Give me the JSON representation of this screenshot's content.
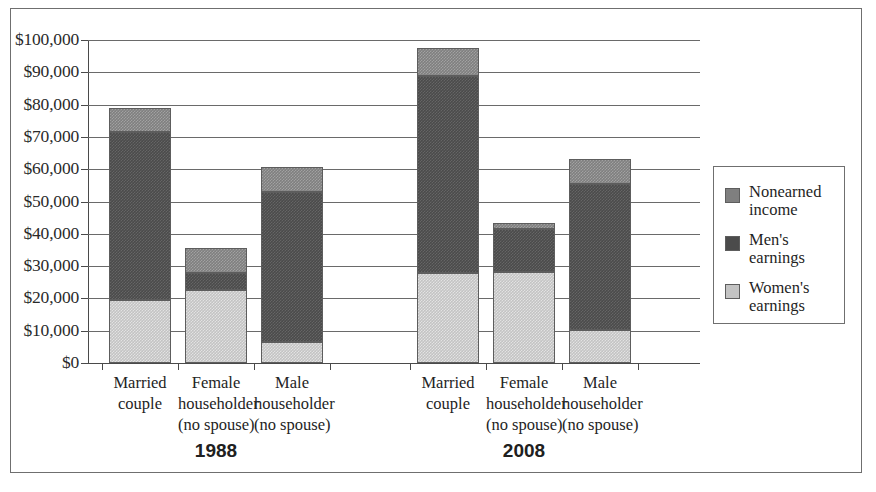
{
  "chart_data": {
    "type": "bar",
    "subtype": "stacked",
    "title": "",
    "xlabel": "",
    "ylabel": "",
    "ylim": [
      0,
      100000
    ],
    "grid": true,
    "legend_position": "right",
    "y_ticks": [
      "$0",
      "$10,000",
      "$20,000",
      "$30,000",
      "$40,000",
      "$50,000",
      "$60,000",
      "$70,000",
      "$80,000",
      "$90,000",
      "$100,000"
    ],
    "y_tick_values": [
      0,
      10000,
      20000,
      30000,
      40000,
      50000,
      60000,
      70000,
      80000,
      90000,
      100000
    ],
    "groups": [
      {
        "label": "1988",
        "categories": [
          {
            "lines": [
              "Married",
              "couple"
            ],
            "women_earnings": 19500,
            "men_earnings": 52000,
            "nonearned_income": 7500,
            "total": 79000
          },
          {
            "lines": [
              "Female",
              "householder",
              "(no spouse)"
            ],
            "women_earnings": 22500,
            "men_earnings": 5300,
            "nonearned_income": 7700,
            "total": 35500
          },
          {
            "lines": [
              "Male",
              "householder",
              "(no spouse)"
            ],
            "women_earnings": 6500,
            "men_earnings": 46500,
            "nonearned_income": 7800,
            "total": 60800
          }
        ]
      },
      {
        "label": "2008",
        "categories": [
          {
            "lines": [
              "Married",
              "couple"
            ],
            "women_earnings": 28000,
            "men_earnings": 61000,
            "nonearned_income": 8500,
            "total": 97500
          },
          {
            "lines": [
              "Female",
              "householder",
              "(no spouse)"
            ],
            "women_earnings": 28200,
            "men_earnings": 13300,
            "nonearned_income": 1700,
            "total": 43200
          },
          {
            "lines": [
              "Male",
              "householder",
              "(no spouse)"
            ],
            "women_earnings": 10300,
            "men_earnings": 45200,
            "nonearned_income": 7700,
            "total": 63200
          }
        ]
      }
    ],
    "series": [
      {
        "name": "Nonearned income",
        "name_lines": [
          "Nonearned",
          "income"
        ],
        "color": "#7f7f7f",
        "key": "nonearned_income"
      },
      {
        "name": "Men's earnings",
        "name_lines": [
          "Men's",
          "earnings"
        ],
        "color": "#4b4b4b",
        "key": "men_earnings"
      },
      {
        "name": "Women's earnings",
        "name_lines": [
          "Women's",
          "earnings"
        ],
        "color": "#c3c3c3",
        "key": "women_earnings"
      }
    ]
  },
  "legend": {
    "items": [
      {
        "line1": "Nonearned",
        "line2": "income"
      },
      {
        "line1": "Men's",
        "line2": "earnings"
      },
      {
        "line1": "Women's",
        "line2": "earnings"
      }
    ]
  },
  "axis": {
    "y_labels": [
      "$100,000",
      "$90,000",
      "$80,000",
      "$70,000",
      "$60,000",
      "$50,000",
      "$40,000",
      "$30,000",
      "$20,000",
      "$10,000",
      "$0"
    ]
  },
  "categories_flat": [
    {
      "l1": "Married",
      "l2": "couple",
      "l3": ""
    },
    {
      "l1": "Female",
      "l2": "householder",
      "l3": "(no spouse)"
    },
    {
      "l1": "Male",
      "l2": "householder",
      "l3": "(no spouse)"
    },
    {
      "l1": "Married",
      "l2": "couple",
      "l3": ""
    },
    {
      "l1": "Female",
      "l2": "householder",
      "l3": "(no spouse)"
    },
    {
      "l1": "Male",
      "l2": "householder",
      "l3": "(no spouse)"
    }
  ],
  "group_labels": [
    {
      "text": "1988"
    },
    {
      "text": "2008"
    }
  ]
}
